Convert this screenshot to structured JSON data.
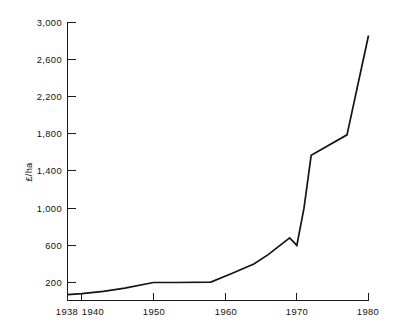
{
  "chart_data": {
    "type": "line",
    "title": "",
    "subtitle": "",
    "xlabel": "",
    "ylabel": "£/ha",
    "xlim": [
      1938,
      1980
    ],
    "ylim": [
      60,
      3000
    ],
    "grid": false,
    "legend": false,
    "legend_position": "none",
    "series_color": "#141414",
    "y_ticks": [
      200,
      600,
      1000,
      1400,
      1800,
      2200,
      2600,
      3000
    ],
    "y_tick_labels": [
      "200",
      "600",
      "1,000",
      "1,400",
      "1,800",
      "2,200",
      "2,600",
      "3,000"
    ],
    "x_ticks": [
      1938,
      1940,
      1950,
      1960,
      1970,
      1980
    ],
    "x_tick_labels": [
      "1938",
      "1940",
      "1950",
      "1960",
      "1970",
      "1980"
    ],
    "series": [
      {
        "name": "Agricultural land price",
        "x": [
          1938,
          1940,
          1943,
          1946,
          1950,
          1953,
          1958,
          1961,
          1964,
          1966,
          1969,
          1970,
          1971,
          1972,
          1977,
          1980
        ],
        "values": [
          70,
          80,
          105,
          140,
          200,
          200,
          205,
          300,
          400,
          500,
          680,
          600,
          1000,
          1570,
          1790,
          2860
        ]
      }
    ],
    "annotations": []
  },
  "axis": {
    "y_title": "£/ha",
    "y_labels": [
      "3,000",
      "2,600",
      "2,200",
      "1,800",
      "1,400",
      "1,000",
      "600",
      "200"
    ],
    "x_labels": [
      "1938",
      "1940",
      "1950",
      "1960",
      "1970",
      "1980"
    ]
  }
}
